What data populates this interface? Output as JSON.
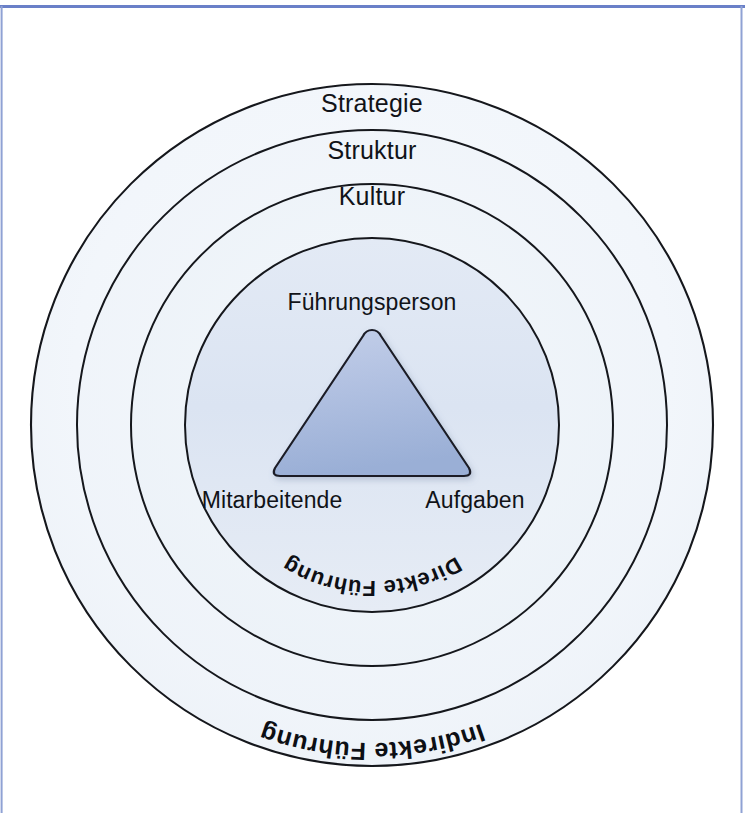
{
  "diagram": {
    "type": "concentric-circles-with-triangle",
    "frame": {
      "accent_color": "#6a80c8"
    },
    "rings": [
      {
        "id": "indirekte-fuehrung",
        "label": "Indirekte Führung",
        "style": "bold-curved-outside",
        "radius": 341,
        "fill": "#f4f7fb",
        "stroke": "#15171c"
      },
      {
        "id": "strategie",
        "label": "Strategie",
        "style": "plain-horizontal",
        "radius": 295,
        "fill": "#f1f5fa",
        "stroke": "#15171c"
      },
      {
        "id": "struktur",
        "label": "Struktur",
        "style": "plain-horizontal",
        "radius": 241,
        "fill": "#eff4f9",
        "stroke": "#15171c"
      },
      {
        "id": "kultur",
        "label": "Kultur",
        "style": "plain-horizontal",
        "radius": 187,
        "fill": "#dde6f3",
        "stroke": "#15171c"
      }
    ],
    "inner_arc_label": {
      "id": "direkte-fuehrung",
      "label": "Direkte Führung",
      "style": "bold-curved-inside"
    },
    "triangle": {
      "id": "fuehrungs-dreieck",
      "fill_top": "#bcc9e6",
      "fill_bottom": "#9cb1d8",
      "stroke": "#1b1e26",
      "vertices": [
        {
          "id": "apex",
          "label": "Führungsperson",
          "position": "top"
        },
        {
          "id": "bottom-left",
          "label": "Mitarbeitende",
          "position": "bottom-left"
        },
        {
          "id": "bottom-right",
          "label": "Aufgaben",
          "position": "bottom-right"
        }
      ]
    },
    "center": {
      "x": 372,
      "y": 425
    }
  }
}
